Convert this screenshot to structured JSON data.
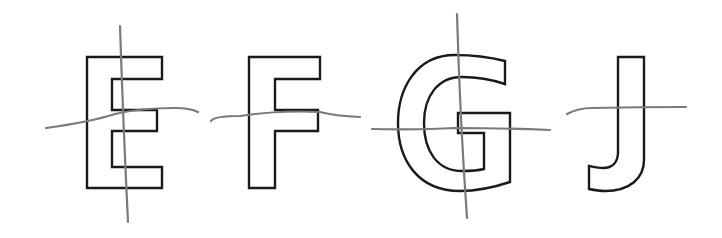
{
  "diagram": {
    "colors": {
      "outline": "#1a1a1a",
      "axis_line": "#7a7a7a",
      "background": "#ffffff"
    },
    "letters": [
      {
        "char": "E",
        "axes": [
          "vertical",
          "horizontal"
        ]
      },
      {
        "char": "F",
        "axes": [
          "horizontal"
        ]
      },
      {
        "char": "G",
        "axes": [
          "vertical",
          "horizontal"
        ]
      },
      {
        "char": "J",
        "axes": [
          "horizontal"
        ]
      }
    ]
  }
}
